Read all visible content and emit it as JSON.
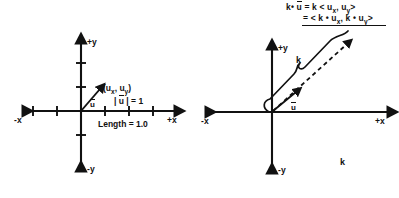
{
  "figure": {
    "background_color": "#ffffff",
    "ink_color": "#111111"
  },
  "left_panel": {
    "name": "unit-vector-diagram",
    "axis_labels": {
      "pos_x": "+x",
      "neg_x": "-x",
      "pos_y": "+y",
      "neg_y": "-y"
    },
    "vector_label": "u",
    "point_label_prefix": "(u",
    "point_label": "(ux, uy)",
    "magnitude_label": "| u | = 1",
    "length_label": "Length = 1.0",
    "ticks": {
      "x_left": [
        -3,
        -2,
        -1
      ],
      "x_right": [
        1,
        2,
        3
      ],
      "y_up": [
        1,
        2
      ],
      "y_down": [
        -1
      ]
    }
  },
  "right_panel": {
    "name": "scalar-multiple-diagram",
    "axis_labels": {
      "pos_x": "+x",
      "neg_x": "-x",
      "pos_y": "+y",
      "neg_y": "-y"
    },
    "vector_label": "u",
    "brace_label": "k",
    "scalar_label": "k",
    "formula_line_1": "k • u = k < ux, uy>",
    "formula_line_2": "= < k • ux, k • uy>",
    "formula_tokens": {
      "k": "k",
      "dot": "•",
      "u": "u",
      "equals": "=",
      "lt": "<",
      "gt": ">",
      "comma": ",",
      "sub_x": "x",
      "sub_y": "y"
    }
  },
  "chart_data": {
    "type": "scatter",
    "xlabel": "+x",
    "ylabel": "+y",
    "panels": [
      {
        "name": "unit vector",
        "xlim": [
          -3.4,
          3.4
        ],
        "ylim": [
          -2.2,
          2.6
        ],
        "grid": false,
        "vectors": [
          {
            "label": "u",
            "from": [
              0,
              0
            ],
            "to": [
              0.72,
              0.82
            ],
            "style": "solid",
            "magnitude": 1.0
          }
        ],
        "annotations": [
          "(ux, uy)",
          "| u | = 1",
          "Length = 1.0"
        ]
      },
      {
        "name": "scaled vector",
        "xlim": [
          -3.4,
          3.4
        ],
        "ylim": [
          -2.2,
          2.6
        ],
        "grid": false,
        "vectors": [
          {
            "label": "u",
            "from": [
              0,
              0
            ],
            "to": [
              0.7,
              0.62
            ],
            "style": "solid",
            "magnitude": 1.0
          },
          {
            "label": "k u",
            "from": [
              0,
              0
            ],
            "to": [
              2.45,
              2.2
            ],
            "style": "dashed",
            "magnitude": 3.3
          }
        ],
        "annotations": [
          "k"
        ]
      }
    ]
  }
}
